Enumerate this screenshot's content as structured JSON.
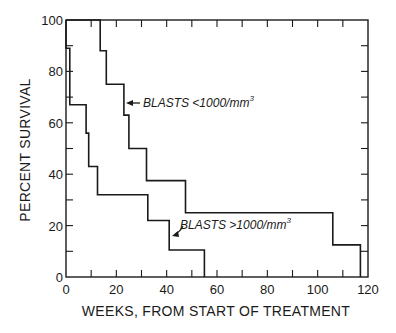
{
  "chart_data": {
    "type": "line",
    "subtype": "step (Kaplan-Meier survival curves)",
    "title": "",
    "xlabel": "WEEKS, FROM START OF TREATMENT",
    "ylabel": "PERCENT SURVIVAL",
    "xlim": [
      0,
      120
    ],
    "ylim": [
      0,
      100
    ],
    "x_ticks": [
      0,
      20,
      40,
      60,
      80,
      100,
      120
    ],
    "x_minor_ticks": [
      10,
      30,
      50,
      70,
      90,
      110
    ],
    "y_ticks": [
      0,
      20,
      40,
      60,
      80,
      100
    ],
    "y_minor_ticks": [
      10,
      30,
      50,
      70,
      90
    ],
    "grid": false,
    "legend": "none (inline annotations with arrows)",
    "series": [
      {
        "name": "BLASTS <1000/mm3",
        "label_text": "BLASTS <1000/mm",
        "label_sup": "3",
        "points": [
          [
            0,
            100
          ],
          [
            13.6,
            100
          ],
          [
            13.6,
            88
          ],
          [
            16,
            88
          ],
          [
            16,
            75
          ],
          [
            23,
            75
          ],
          [
            23,
            63
          ],
          [
            25,
            63
          ],
          [
            25,
            50
          ],
          [
            32,
            50
          ],
          [
            32,
            37.5
          ],
          [
            47.5,
            37.5
          ],
          [
            47.5,
            25
          ],
          [
            106,
            25
          ],
          [
            106,
            12.5
          ],
          [
            117,
            12.5
          ],
          [
            117,
            0
          ]
        ]
      },
      {
        "name": "BLASTS >1000/mm3",
        "label_text": "BLASTS >1000/mm",
        "label_sup": "3",
        "points": [
          [
            0,
            100
          ],
          [
            0,
            89
          ],
          [
            1.5,
            89
          ],
          [
            1.5,
            67
          ],
          [
            8,
            67
          ],
          [
            8,
            56
          ],
          [
            9,
            56
          ],
          [
            9,
            43
          ],
          [
            12.5,
            43
          ],
          [
            12.5,
            32
          ],
          [
            32.5,
            32
          ],
          [
            32.5,
            22
          ],
          [
            41,
            22
          ],
          [
            41,
            10.5
          ],
          [
            55,
            10.5
          ],
          [
            55,
            0
          ]
        ]
      }
    ]
  }
}
